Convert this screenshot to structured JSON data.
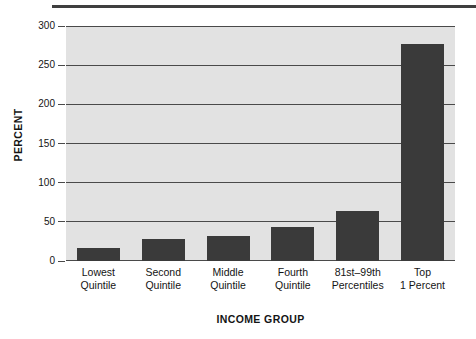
{
  "chart_data": {
    "type": "bar",
    "title": "",
    "subtitle": "",
    "xlabel": "INCOME GROUP",
    "ylabel": "PERCENT",
    "categories": [
      "Lowest Quintile",
      "Second Quintile",
      "Middle Quintile",
      "Fourth Quintile",
      "81st–99th Percentiles",
      "Top 1 Percent"
    ],
    "category_lines": [
      [
        "Lowest",
        "Quintile"
      ],
      [
        "Second",
        "Quintile"
      ],
      [
        "Middle",
        "Quintile"
      ],
      [
        "Fourth",
        "Quintile"
      ],
      [
        "81st–99th",
        "Percentiles"
      ],
      [
        "Top",
        "1 Percent"
      ]
    ],
    "values": [
      17,
      28,
      32,
      44,
      64,
      277
    ],
    "ylim": [
      0,
      300
    ],
    "ytick_values": [
      0,
      50,
      100,
      150,
      200,
      250,
      300
    ],
    "ytick_labels": [
      "0",
      "50",
      "100",
      "150",
      "200",
      "250",
      "300"
    ],
    "grid": "horizontal",
    "legend": "none",
    "bar_color": "#3a3a3a",
    "plot_background": "#e2e2e2",
    "axis_color": "#4a4a4a",
    "text_color": "#141414"
  }
}
